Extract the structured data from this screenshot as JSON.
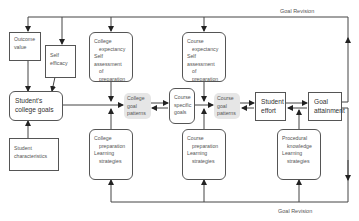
{
  "diagram": {
    "top_label": "Goal Revision",
    "bottom_label": "Goal Revision",
    "nodes": {
      "outcome_value": [
        "Outcome",
        "value"
      ],
      "self_efficacy": [
        "Self",
        "efficacy"
      ],
      "students_college_goals": [
        "Student's",
        "college goals"
      ],
      "student_characteristics": [
        "Student",
        "characteristics"
      ],
      "college_expectancy": [
        "College",
        "expectancy",
        "Self assessment",
        "of preparation"
      ],
      "college_goal_patterns": [
        "College",
        "goal",
        "patterns"
      ],
      "course_specific_goals": [
        "Course",
        "specific",
        "goals"
      ],
      "course_expectancy": [
        "Course",
        "expectancy",
        "Self assessment",
        "of preparation"
      ],
      "course_goal_patterns": [
        "Course",
        "goal",
        "patterns"
      ],
      "student_effort": [
        "Student",
        "effort"
      ],
      "goal_attainment": [
        "Goal",
        "attainment"
      ],
      "college_preparation": [
        "College",
        "preparation",
        "Learning",
        "strategies"
      ],
      "course_preparation": [
        "Course",
        "preparation",
        "Learning",
        "strategies"
      ],
      "procedural_knowledge": [
        "Procedural",
        "knowledge",
        "Learning",
        "strategies"
      ]
    }
  }
}
